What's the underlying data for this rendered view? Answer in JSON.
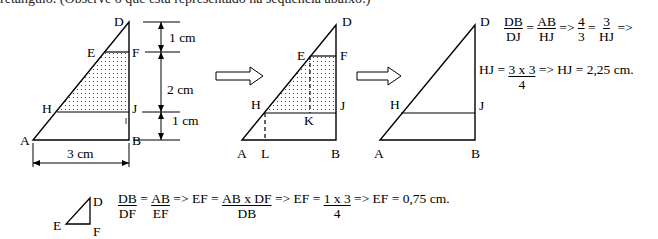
{
  "top_text": "retângulo. (Observe o que está representado na sequência abaixo:)",
  "figure1": {
    "points": {
      "A": "A",
      "B": "B",
      "D": "D",
      "E": "E",
      "F": "F",
      "H": "H",
      "J": "J"
    },
    "dim_top": "1 cm",
    "dim_mid": "2 cm",
    "dim_bottom": "1 cm",
    "dim_base": "3 cm"
  },
  "figure2": {
    "points": {
      "A": "A",
      "B": "B",
      "D": "D",
      "E": "E",
      "F": "F",
      "H": "H",
      "J": "J",
      "K": "K",
      "L": "L"
    }
  },
  "figure3": {
    "points": {
      "A": "A",
      "B": "B",
      "D": "D",
      "H": "H",
      "J": "J"
    }
  },
  "small_triangle": {
    "points": {
      "D": "D",
      "E": "E",
      "F": "F"
    }
  },
  "equation1": {
    "frac1_num": "DB",
    "frac1_den": "DJ",
    "eq": " = ",
    "frac2_num": "AB",
    "frac2_den": "HJ",
    "implies": " => ",
    "frac3_num": "4",
    "frac3_den": "3",
    "frac4_num": "3",
    "frac4_den": "HJ",
    "tail": " =>"
  },
  "equation2": {
    "lhs": "HJ = ",
    "frac_num": "3 x 3",
    "frac_den": "4",
    "rhs": " => HJ = 2,25 cm."
  },
  "equation3": {
    "frac1_num": "DB",
    "frac1_den": "DF",
    "frac2_num": "AB",
    "frac2_den": "EF",
    "mid1": " => EF = ",
    "frac3_num": "AB x DF",
    "frac3_den": "DB",
    "mid2": " => EF = ",
    "frac4_num": "1 x 3",
    "frac4_den": "4",
    "rhs": " => EF = 0,75 cm."
  }
}
